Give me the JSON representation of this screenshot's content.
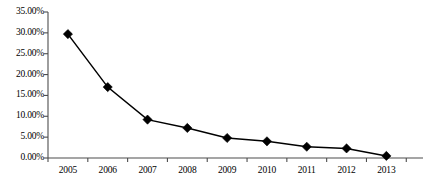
{
  "chart_data": {
    "type": "line",
    "title": "",
    "subtitle": "",
    "xlabel": "",
    "ylabel": "",
    "categories": [
      "2005",
      "2006",
      "2007",
      "2008",
      "2009",
      "2010",
      "2011",
      "2012",
      "2013"
    ],
    "values": [
      29.7,
      17.0,
      9.2,
      7.2,
      4.8,
      4.0,
      2.7,
      2.3,
      0.5
    ],
    "value_suffix": "%",
    "ylim": [
      0,
      35
    ],
    "ytick_values": [
      0,
      5,
      10,
      15,
      20,
      25,
      30,
      35
    ],
    "ytick_labels": [
      "0.00%",
      "5.00%",
      "10.00%",
      "15.00%",
      "20.00%",
      "25.00%",
      "30.00%",
      "35.00%"
    ],
    "grid": false,
    "legend": null,
    "legend_position": "none",
    "series": [
      {
        "name": "",
        "marker": "diamond",
        "marker_color": "#000000",
        "line_color": "#000000",
        "values": [
          29.7,
          17.0,
          9.2,
          7.2,
          4.8,
          4.0,
          2.7,
          2.3,
          0.5
        ]
      }
    ],
    "annotations": []
  },
  "colors": {
    "line": "#000000",
    "marker": "#000000",
    "axis": "#4d4d4d",
    "background": "#ffffff",
    "text": "#000000"
  }
}
